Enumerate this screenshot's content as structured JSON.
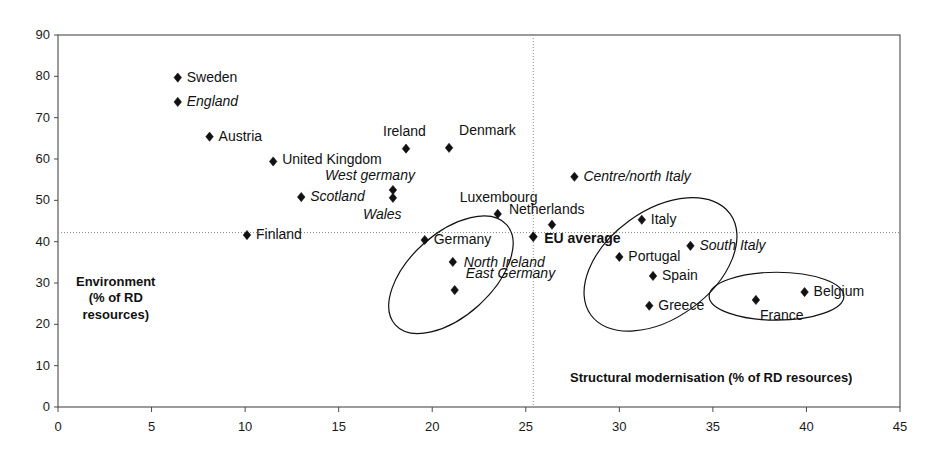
{
  "chart_data": {
    "type": "scatter",
    "title": "",
    "xlabel": "Structural modernisation (% of RD resources)",
    "ylabel": "Environment (% of RD resources)",
    "ylabel_lines": [
      "Environment",
      "(% of RD",
      "resources)"
    ],
    "xlim": [
      0,
      45
    ],
    "ylim": [
      0,
      90
    ],
    "xticks": [
      0,
      5,
      10,
      15,
      20,
      25,
      30,
      35,
      40,
      45
    ],
    "yticks": [
      0,
      10,
      20,
      30,
      40,
      50,
      60,
      70,
      80,
      90
    ],
    "grid": false,
    "legend": "none",
    "marker": "filled-diamond",
    "marker_color": "#111111",
    "reference_lines": [
      {
        "name": "eu-average-horizontal",
        "orientation": "horizontal",
        "value": 42.2,
        "style": "dotted"
      },
      {
        "name": "eu-average-vertical",
        "orientation": "vertical",
        "value": 25.4,
        "style": "dotted"
      }
    ],
    "points": [
      {
        "label": "Sweden",
        "x": 6.4,
        "y": 79.7,
        "style": "normal",
        "label_pos": "right"
      },
      {
        "label": "England",
        "x": 6.4,
        "y": 73.8,
        "style": "italic",
        "label_pos": "right"
      },
      {
        "label": "Austria",
        "x": 8.1,
        "y": 65.4,
        "style": "normal",
        "label_pos": "right"
      },
      {
        "label": "United Kingdom",
        "x": 11.5,
        "y": 59.4,
        "style": "normal",
        "label_pos": "right"
      },
      {
        "label": "Scotland",
        "x": 13.0,
        "y": 50.8,
        "style": "italic",
        "label_pos": "right"
      },
      {
        "label": "West germany",
        "x": 17.9,
        "y": 52.5,
        "style": "italic",
        "label_pos": "above"
      },
      {
        "label": "Wales",
        "x": 17.9,
        "y": 50.6,
        "style": "italic",
        "label_pos": "below"
      },
      {
        "label": "Ireland",
        "x": 18.6,
        "y": 62.5,
        "style": "normal",
        "label_pos": "above"
      },
      {
        "label": "Denmark",
        "x": 20.9,
        "y": 62.7,
        "style": "normal",
        "label_pos": "above-right"
      },
      {
        "label": "Luxembourg",
        "x": 23.5,
        "y": 46.7,
        "style": "normal",
        "label_pos": "above"
      },
      {
        "label": "Finland",
        "x": 10.1,
        "y": 41.6,
        "style": "normal",
        "label_pos": "right"
      },
      {
        "label": "Germany",
        "x": 19.6,
        "y": 40.4,
        "style": "normal",
        "label_pos": "right"
      },
      {
        "label": "North Ireland",
        "x": 21.1,
        "y": 35.1,
        "style": "italic",
        "label_pos": "right"
      },
      {
        "label": "East Germany",
        "x": 21.2,
        "y": 28.3,
        "style": "italic",
        "label_pos": "above-right"
      },
      {
        "label": "EU average",
        "x": 25.4,
        "y": 41.2,
        "style": "bold",
        "label_pos": "right"
      },
      {
        "label": "Netherlands",
        "x": 26.4,
        "y": 44.1,
        "style": "normal",
        "label_pos": "above"
      },
      {
        "label": "Centre/north Italy",
        "x": 27.6,
        "y": 55.7,
        "style": "italic",
        "label_pos": "right"
      },
      {
        "label": "Italy",
        "x": 31.2,
        "y": 45.3,
        "style": "normal",
        "label_pos": "right"
      },
      {
        "label": "Portugal",
        "x": 30.0,
        "y": 36.3,
        "style": "normal",
        "label_pos": "right"
      },
      {
        "label": "South Italy",
        "x": 33.8,
        "y": 39.0,
        "style": "italic",
        "label_pos": "right"
      },
      {
        "label": "Spain",
        "x": 31.8,
        "y": 31.7,
        "style": "normal",
        "label_pos": "right"
      },
      {
        "label": "Greece",
        "x": 31.6,
        "y": 24.5,
        "style": "normal",
        "label_pos": "right"
      },
      {
        "label": "France",
        "x": 37.3,
        "y": 25.9,
        "style": "normal",
        "label_pos": "below-right"
      },
      {
        "label": "Belgium",
        "x": 39.9,
        "y": 27.8,
        "style": "normal",
        "label_pos": "right"
      }
    ],
    "groupings": [
      {
        "name": "lagging-regions-cluster",
        "cx": 21.0,
        "cy": 32.0,
        "rx": 4.0,
        "ry": 10.0,
        "rotation": -42
      },
      {
        "name": "southern-europe-cluster",
        "cx": 32.2,
        "cy": 34.5,
        "rx": 4.6,
        "ry": 13.0,
        "rotation": -36
      },
      {
        "name": "france-belgium-cluster",
        "cx": 38.4,
        "cy": 26.8,
        "rx": 3.6,
        "ry": 5.8,
        "rotation": 0
      }
    ]
  },
  "axes": {
    "x_tick_labels": [
      "0",
      "5",
      "10",
      "15",
      "20",
      "25",
      "30",
      "35",
      "40",
      "45"
    ],
    "y_tick_labels": [
      "0",
      "10",
      "20",
      "30",
      "40",
      "50",
      "60",
      "70",
      "80",
      "90"
    ]
  },
  "annotations": {
    "y_axis_note_line1": "Environment",
    "y_axis_note_line2": "(% of RD",
    "y_axis_note_line3": "resources)",
    "x_axis_note": "Structural modernisation (% of RD resources)"
  },
  "colors": {
    "marker": "#111111",
    "axis": "#4a4a4a",
    "grid_dotted": "#8a8a8a",
    "text": "#111111",
    "background": "#ffffff"
  }
}
